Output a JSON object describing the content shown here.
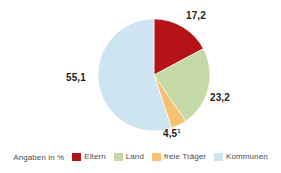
{
  "chart_data": {
    "type": "pie",
    "title": "",
    "subtitle": "",
    "xlabel": "",
    "ylabel": "",
    "units": "%",
    "caption": "Angaben in %",
    "legend_position": "bottom",
    "grid": false,
    "total": 100.0,
    "start_angle_deg": 0,
    "direction": "clockwise",
    "categories": [
      "Eltern",
      "Land",
      "freie Träger",
      "Kommunen"
    ],
    "values": [
      17.2,
      23.2,
      4.5,
      55.1
    ],
    "labels": [
      "17,2",
      "23,2",
      "4,5",
      "55,1"
    ],
    "colors": [
      "#B51219",
      "#C5D9A6",
      "#F6C272",
      "#CFE4F1"
    ],
    "footnotes": [
      "1"
    ],
    "slices": [
      {
        "name": "Eltern",
        "value": 17.2,
        "label": "17,2",
        "color": "#B51219",
        "footnote": ""
      },
      {
        "name": "Land",
        "value": 23.2,
        "label": "23,2",
        "color": "#C5D9A6",
        "footnote": ""
      },
      {
        "name": "freie Träger",
        "value": 4.5,
        "label": "4,5",
        "color": "#F6C272",
        "footnote": "1"
      },
      {
        "name": "Kommunen",
        "value": 55.1,
        "label": "55,1",
        "color": "#CFE4F1",
        "footnote": ""
      }
    ]
  },
  "legend": {
    "caption": "Angaben in %",
    "items": [
      {
        "label": "Eltern",
        "color": "#B51219"
      },
      {
        "label": "Land",
        "color": "#C5D9A6"
      },
      {
        "label": "freie Träger",
        "color": "#F6C272"
      },
      {
        "label": "Kommunen",
        "color": "#CFE4F1"
      }
    ]
  },
  "geometry": {
    "center_x": 154,
    "center_y": 75,
    "radius": 56
  }
}
